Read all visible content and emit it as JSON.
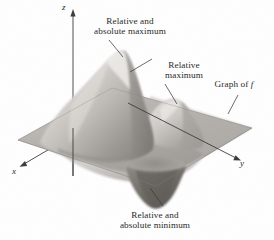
{
  "figure": {
    "kind": "3d-surface-plot",
    "background_color": "#ffffff",
    "ink_color": "#2a2a2a",
    "surface_fill_light": "#d8d6d2",
    "surface_fill_mid": "#a9a6a1",
    "surface_fill_dark": "#6f6c68"
  },
  "axes": {
    "z_label": "z",
    "x_label": "x",
    "y_label": "y"
  },
  "annotations": [
    {
      "id": "absolute-maximum",
      "line1": "Relative and",
      "line2": "absolute maximum"
    },
    {
      "id": "relative-maximum",
      "line1": "Relative",
      "line2": "maximum"
    },
    {
      "id": "graph-of-f",
      "line1": "Graph of",
      "line2": "f"
    },
    {
      "id": "absolute-minimum",
      "line1": "Relative and",
      "line2": "absolute minimum"
    }
  ]
}
